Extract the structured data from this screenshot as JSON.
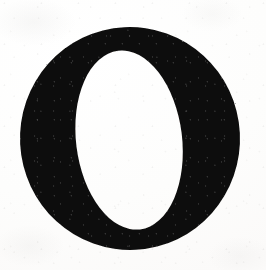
{
  "image": {
    "kind": "scanned-letterform",
    "glyph": "O",
    "alt_text": "Capital letter O",
    "caption": "",
    "width": 266,
    "height": 270
  },
  "colors": {
    "ink": "#100f0e",
    "ink_edge": "#1b1a18",
    "paper": "#fdfdfc",
    "paper_white": "#ffffff",
    "speckle": "#787673"
  },
  "geometry": {
    "outer": {
      "cx": 130,
      "cy": 138.5,
      "rx": 110,
      "ry": 111.5,
      "rotate": -3
    },
    "counter": {
      "cx": 129,
      "cy": 140,
      "rx": 53,
      "ry": 90,
      "rotate": -4
    }
  },
  "notes": {
    "style": "high-contrast didone serif",
    "background_label": "paper",
    "foreground_label": "ink"
  }
}
